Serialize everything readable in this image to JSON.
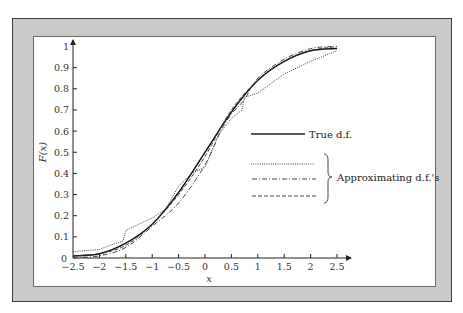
{
  "chart_data": {
    "type": "line",
    "title": "",
    "xlabel": "x",
    "ylabel": "F(x)",
    "xlim": [
      -2.5,
      2.5
    ],
    "ylim": [
      0,
      1
    ],
    "grid": false,
    "x_ticks": [
      "−2.5",
      "−2",
      "−1.5",
      "−1",
      "−0.5",
      "0",
      "0.5",
      "1",
      "1.5",
      "2",
      "2.5"
    ],
    "y_ticks": [
      "0",
      "0.1",
      "0.2",
      "0.3",
      "0.4",
      "0.5",
      "0.6",
      "0.7",
      "0.8",
      "0.9",
      "1"
    ],
    "legend_position": "right-center",
    "legend": {
      "true_label": "True d.f.",
      "approx_label": "Approximating d.f.'s"
    },
    "series": [
      {
        "name": "True d.f.",
        "style": "solid",
        "x": [
          -2.5,
          -2.0,
          -1.5,
          -1.0,
          -0.5,
          0.0,
          0.5,
          1.0,
          1.5,
          2.0,
          2.5
        ],
        "y": [
          0.01,
          0.02,
          0.07,
          0.16,
          0.31,
          0.5,
          0.69,
          0.84,
          0.93,
          0.98,
          0.99
        ]
      },
      {
        "name": "Approximating d.f. (dotted)",
        "style": "dotted",
        "x": [
          -2.5,
          -2.0,
          -1.8,
          -1.55,
          -1.5,
          -1.0,
          -0.75,
          -0.5,
          -0.25,
          0.0,
          0.25,
          0.5,
          0.7,
          0.75,
          1.0,
          1.5,
          2.0,
          2.5
        ],
        "y": [
          0.03,
          0.04,
          0.06,
          0.08,
          0.13,
          0.19,
          0.23,
          0.34,
          0.4,
          0.43,
          0.58,
          0.66,
          0.7,
          0.76,
          0.78,
          0.87,
          0.93,
          0.98
        ]
      },
      {
        "name": "Approximating d.f. (dash-dot)",
        "style": "dash-dot",
        "x": [
          -2.5,
          -2.0,
          -1.5,
          -1.0,
          -0.5,
          0.0,
          0.3,
          0.5,
          0.75,
          1.0,
          1.5,
          2.0,
          2.4
        ],
        "y": [
          0.0,
          0.01,
          0.05,
          0.15,
          0.26,
          0.44,
          0.6,
          0.68,
          0.75,
          0.85,
          0.94,
          0.99,
          1.0
        ]
      },
      {
        "name": "Approximating d.f. (dashed)",
        "style": "dashed",
        "x": [
          -2.5,
          -2.0,
          -1.5,
          -1.0,
          -0.5,
          0.0,
          0.5,
          1.0,
          1.5,
          2.0,
          2.5
        ],
        "y": [
          0.01,
          0.02,
          0.06,
          0.16,
          0.3,
          0.48,
          0.7,
          0.84,
          0.93,
          0.98,
          1.0
        ]
      }
    ]
  }
}
